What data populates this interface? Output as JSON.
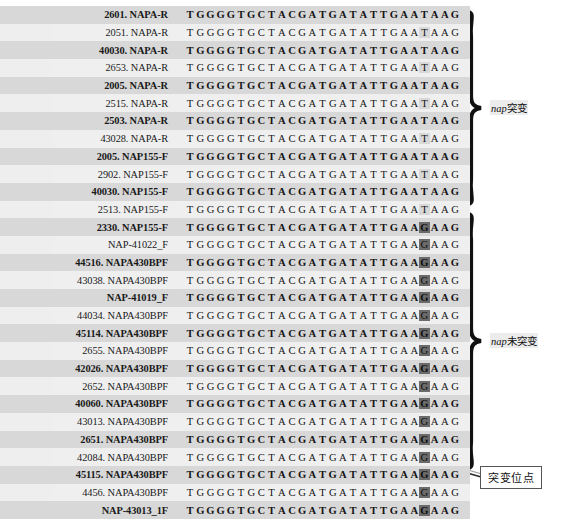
{
  "figure": {
    "type": "sequence-alignment",
    "sequence_length": 27,
    "variant_index": 23,
    "variant_bases": {
      "mutant": "T",
      "wildtype": "G"
    },
    "prefix": [
      "T",
      "G",
      "G",
      "G",
      "G",
      "T",
      "G",
      "C",
      "T",
      "A",
      "C",
      "G",
      "A",
      "T",
      "G",
      "A",
      "T",
      "A",
      "T",
      "T",
      "G",
      "A",
      "A"
    ],
    "suffix": [
      "A",
      "A",
      "G"
    ],
    "highlight_color": "#6b6b6b",
    "stripe_color": "#d8d8d8",
    "row_alt_color": "#efefef"
  },
  "rows": [
    {
      "label": "2601. NAPA-R",
      "variant": "T",
      "group": "mutant"
    },
    {
      "label": "2051. NAPA-R",
      "variant": "T",
      "group": "mutant"
    },
    {
      "label": "40030. NAPA-R",
      "variant": "T",
      "group": "mutant"
    },
    {
      "label": "2653. NAPA-R",
      "variant": "T",
      "group": "mutant"
    },
    {
      "label": "2005. NAPA-R",
      "variant": "T",
      "group": "mutant"
    },
    {
      "label": "2515. NAPA-R",
      "variant": "T",
      "group": "mutant"
    },
    {
      "label": "2503. NAPA-R",
      "variant": "T",
      "group": "mutant"
    },
    {
      "label": "43028. NAPA-R",
      "variant": "T",
      "group": "mutant"
    },
    {
      "label": "2005. NAP155-F",
      "variant": "T",
      "group": "mutant"
    },
    {
      "label": "2902. NAP155-F",
      "variant": "T",
      "group": "mutant"
    },
    {
      "label": "40030. NAP155-F",
      "variant": "T",
      "group": "mutant"
    },
    {
      "label": "2513. NAP155-F",
      "variant": "T",
      "group": "mutant"
    },
    {
      "label": "2330. NAP155-F",
      "variant": "G",
      "group": "wildtype"
    },
    {
      "label": "NAP-41022_F",
      "variant": "G",
      "group": "wildtype"
    },
    {
      "label": "44516. NAPA430BPF",
      "variant": "G",
      "group": "wildtype"
    },
    {
      "label": "43038. NAPA430BPF",
      "variant": "G",
      "group": "wildtype"
    },
    {
      "label": "NAP-41019_F",
      "variant": "G",
      "group": "wildtype"
    },
    {
      "label": "44034. NAPA430BPF",
      "variant": "G",
      "group": "wildtype"
    },
    {
      "label": "45114. NAPA430BPF",
      "variant": "G",
      "group": "wildtype"
    },
    {
      "label": "2655. NAPA430BPF",
      "variant": "G",
      "group": "wildtype"
    },
    {
      "label": "42026. NAPA430BPF",
      "variant": "G",
      "group": "wildtype"
    },
    {
      "label": "2652. NAPA430BPF",
      "variant": "G",
      "group": "wildtype"
    },
    {
      "label": "40060. NAPA430BPF",
      "variant": "G",
      "group": "wildtype"
    },
    {
      "label": "43013. NAPA430BPF",
      "variant": "G",
      "group": "wildtype"
    },
    {
      "label": "2651. NAPA430BPF",
      "variant": "G",
      "group": "wildtype"
    },
    {
      "label": "42084. NAPA430BPF",
      "variant": "G",
      "group": "wildtype"
    },
    {
      "label": "45115. NAPA430BPF",
      "variant": "G",
      "group": "wildtype"
    },
    {
      "label": "4456. NAPA430BPF",
      "variant": "G",
      "group": "wildtype"
    },
    {
      "label": "NAP-43013_1F",
      "variant": "G",
      "group": "wildtype"
    }
  ],
  "annotations": {
    "brace_mutant": {
      "gene": "nap",
      "text": "突变"
    },
    "brace_wildtype": {
      "gene": "nap",
      "text": "未突变"
    },
    "callout": {
      "text": "突变位点"
    }
  },
  "caption": {
    "text": ""
  }
}
